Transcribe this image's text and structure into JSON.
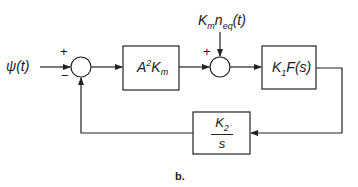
{
  "figure": {
    "caption": "b.",
    "input": {
      "symbol": "ψ",
      "arg": "(t)"
    },
    "disturbance": {
      "main": "K",
      "main_sub": "m",
      "var": "n",
      "var_sub": "eq",
      "arg": "(t)"
    },
    "summing_junction_1": {
      "plus_sign": "+",
      "minus_sign": "−"
    },
    "summing_junction_2": {
      "plus_sign": "+"
    },
    "blocks": {
      "forward_gain": {
        "base": "A",
        "sup": "2",
        "k": "K",
        "k_sub": "m"
      },
      "plant": {
        "k": "K",
        "k_sub": "1",
        "func": "F(s)"
      },
      "feedback": {
        "numerator": "K",
        "numerator_sub": "2",
        "denominator": "s"
      }
    }
  },
  "colors": {
    "line": "#222222",
    "background": "#ffffff"
  }
}
